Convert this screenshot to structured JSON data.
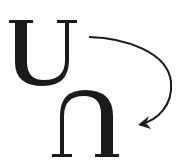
{
  "diagram": {
    "source_glyph": "U",
    "target_glyph": "∩",
    "arrow": {
      "direction": "clockwise",
      "from": "source_glyph",
      "to": "target_glyph"
    },
    "colors": {
      "ink": "#1a1a1a",
      "background": "#ffffff"
    }
  }
}
